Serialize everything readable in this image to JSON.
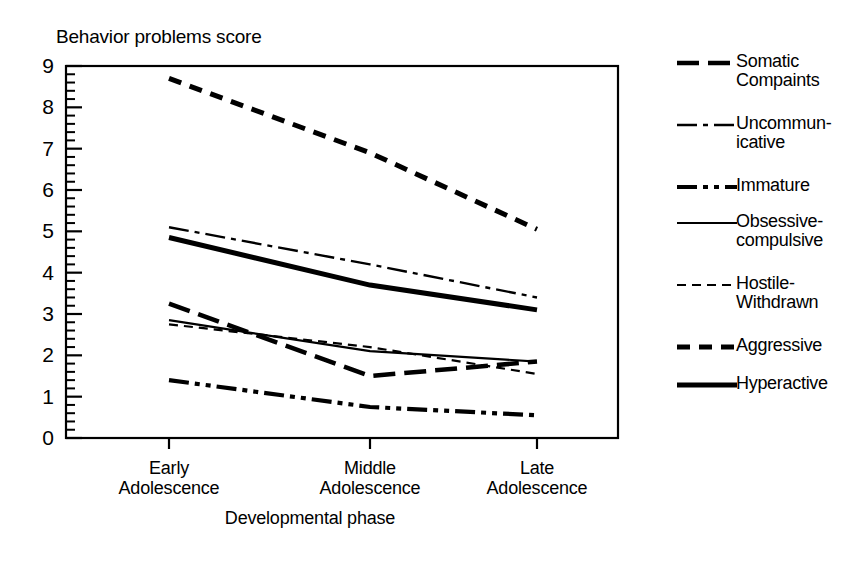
{
  "chart_data": {
    "type": "line",
    "title": "",
    "ylabel": "Behavior problems score",
    "xlabel": "Developmental phase",
    "categories": [
      "Early\nAdolescence",
      "Middle\nAdolescence",
      "Late\nAdolescence"
    ],
    "ylim": [
      0,
      9
    ],
    "yticks": [
      "0",
      "1",
      "2",
      "3",
      "4",
      "5",
      "6",
      "7",
      "8",
      "9"
    ],
    "minor_ticks_per_unit": 5,
    "grid": false,
    "legend_position": "right",
    "series": [
      {
        "name": "Somatic\nCompaints",
        "values": [
          3.25,
          1.5,
          1.85
        ],
        "style": "long-dash-thick"
      },
      {
        "name": "Uncommun-\nicative",
        "values": [
          5.1,
          4.2,
          3.4
        ],
        "style": "dash-dot-thin"
      },
      {
        "name": "Immature",
        "values": [
          1.4,
          0.75,
          0.55
        ],
        "style": "dash-dot-dot-thick"
      },
      {
        "name": "Obsessive-\ncompulsive",
        "values": [
          2.85,
          2.1,
          1.85
        ],
        "style": "solid-thin"
      },
      {
        "name": "Hostile-\nWithdrawn",
        "values": [
          2.75,
          2.2,
          1.55
        ],
        "style": "short-dash-thin"
      },
      {
        "name": "Aggressive",
        "values": [
          8.7,
          6.9,
          5.05
        ],
        "style": "short-dash-thick"
      },
      {
        "name": "Hyperactive",
        "values": [
          4.85,
          3.7,
          3.1
        ],
        "style": "solid-thick"
      }
    ]
  },
  "axes": {
    "y_title": "Behavior problems score",
    "x_title": "Developmental phase",
    "y_tick_labels": [
      "9",
      "8",
      "7",
      "6",
      "5",
      "4",
      "3",
      "2",
      "1",
      "0"
    ],
    "x_tick_labels": [
      "Early\nAdolescence",
      "Middle\nAdolescence",
      "Late\nAdolescence"
    ]
  },
  "legend": {
    "items": [
      {
        "label": "Somatic\nCompaints"
      },
      {
        "label": "Uncommun-\nicative"
      },
      {
        "label": "Immature"
      },
      {
        "label": "Obsessive-\ncompulsive"
      },
      {
        "label": "Hostile-\nWithdrawn"
      },
      {
        "label": "Aggressive"
      },
      {
        "label": "Hyperactive"
      }
    ]
  },
  "colors": {
    "ink": "#000000",
    "paper": "#ffffff"
  }
}
